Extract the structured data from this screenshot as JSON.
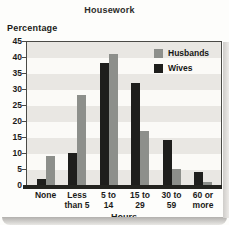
{
  "title": "Housework",
  "y_axis": {
    "label": "Percentage"
  },
  "x_axis": {
    "label": "Hours"
  },
  "legend": {
    "items": [
      {
        "label": "Husbands",
        "color": "#8d8f8b"
      },
      {
        "label": "Wives",
        "color": "#1e1e1c"
      }
    ]
  },
  "chart_data": {
    "type": "bar",
    "title": "Housework",
    "xlabel": "Hours",
    "ylabel": "Percentage",
    "categories": [
      "None",
      "Less than 5",
      "5 to 14",
      "15 to 29",
      "30 to 59",
      "60 or more"
    ],
    "category_label_lines": [
      [
        "None"
      ],
      [
        "Less",
        "than 5"
      ],
      [
        "5 to",
        "14"
      ],
      [
        "15 to",
        "29"
      ],
      [
        "30 to",
        "59"
      ],
      [
        "60 or",
        "more"
      ]
    ],
    "series": [
      {
        "name": "Husbands",
        "color": "#8d8f8b",
        "values": [
          9,
          28,
          41,
          17,
          5,
          1
        ]
      },
      {
        "name": "Wives",
        "color": "#1e1e1c",
        "values": [
          2,
          10,
          38,
          32,
          14,
          4
        ]
      }
    ],
    "bar_order_in_cluster": [
      "Wives",
      "Husbands"
    ],
    "ylim": [
      0,
      45
    ],
    "ytick_step": 5,
    "yticks": [
      45,
      40,
      35,
      30,
      25,
      20,
      15,
      10,
      5,
      0
    ],
    "grid": "horizontal-bands",
    "plot_background_bands": [
      "#e9e7e3",
      "#fbfaf7"
    ],
    "legend_position": "top-right-inside"
  }
}
